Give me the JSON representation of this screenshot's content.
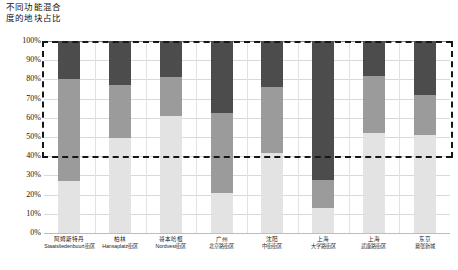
{
  "chart_data": {
    "type": "bar",
    "title": "不同功能混合\n度的地块占比",
    "xlabel": "",
    "ylabel": "",
    "ylim": [
      0,
      100
    ],
    "stacked": true,
    "grid": true,
    "legend_position": "none",
    "y_ticks": [
      "0%",
      "10%",
      "20%",
      "30%",
      "40%",
      "50%",
      "60%",
      "70%",
      "80%",
      "90%",
      "100%"
    ],
    "y_tick_values": [
      0,
      10,
      20,
      30,
      40,
      50,
      60,
      70,
      80,
      90,
      100
    ],
    "annotations": [
      {
        "name": "reference-line-40",
        "type": "dashed-horizontal",
        "value": 40
      },
      {
        "name": "dashed-frame-left",
        "type": "dashed-vertical",
        "from": 40,
        "to": 100
      },
      {
        "name": "dashed-frame-right",
        "type": "dashed-vertical",
        "from": 40,
        "to": 100
      },
      {
        "name": "dashed-frame-top",
        "type": "dashed-horizontal",
        "value": 100
      }
    ],
    "categories": [
      {
        "city": "阿姆斯特丹",
        "district": "Staatsliedenbuurt街区"
      },
      {
        "city": "柏林",
        "district": "Hansaplatz街区"
      },
      {
        "city": "哥本哈根",
        "district": "Nordvest街区"
      },
      {
        "city": "广州",
        "district": "北京路街区"
      },
      {
        "city": "沈阳",
        "district": "中街街区"
      },
      {
        "city": "上海",
        "district": "大学路街区"
      },
      {
        "city": "上海",
        "district": "武康路街区"
      },
      {
        "city": "东京",
        "district": "幕张新城"
      }
    ],
    "series": [
      {
        "name": "low-mix",
        "color": "#e3e3e3",
        "values": [
          27,
          49.5,
          61,
          21,
          41.5,
          13,
          52,
          51
        ]
      },
      {
        "name": "medium-mix",
        "color": "#9b9b9b",
        "values": [
          53,
          27.5,
          20,
          41.5,
          34.5,
          14.5,
          30,
          21
        ]
      },
      {
        "name": "high-mix",
        "color": "#4c4c4c",
        "values": [
          20,
          23,
          19,
          37.5,
          24,
          72.5,
          18,
          28
        ]
      }
    ],
    "cumulative_tops": [
      [
        27,
        80,
        100
      ],
      [
        49.5,
        77,
        100
      ],
      [
        61,
        81,
        100
      ],
      [
        21,
        62.5,
        100
      ],
      [
        41.5,
        76,
        100
      ],
      [
        13,
        27.5,
        100
      ],
      [
        52,
        82,
        100
      ],
      [
        51,
        72,
        100
      ]
    ]
  }
}
